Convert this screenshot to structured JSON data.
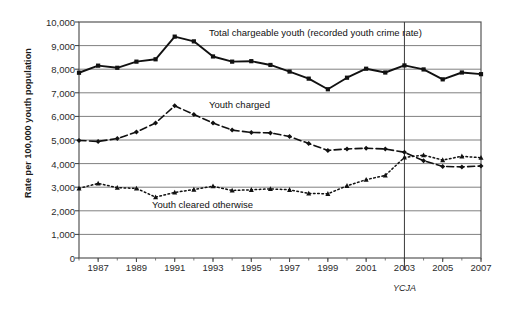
{
  "chart_data": {
    "type": "line",
    "title": "",
    "xlabel": "",
    "ylabel": "Rate per 100,000 youth population",
    "x": [
      1986,
      1987,
      1988,
      1989,
      1990,
      1991,
      1992,
      1993,
      1994,
      1995,
      1996,
      1997,
      1998,
      1999,
      2000,
      2001,
      2002,
      2003,
      2004,
      2005,
      2006,
      2007
    ],
    "xlim": [
      1986,
      2007
    ],
    "ylim": [
      0,
      10000
    ],
    "ytick_labels": [
      "10,000",
      "9,000",
      "8,000",
      "7,000",
      "6,000",
      "5,000",
      "4,000",
      "3,000",
      "2,000",
      "1,000",
      "0"
    ],
    "ytick_values": [
      10000,
      9000,
      8000,
      7000,
      6000,
      5000,
      4000,
      3000,
      2000,
      1000,
      0
    ],
    "xtick_labels": [
      "1987",
      "1989",
      "1991",
      "1993",
      "1995",
      "1997",
      "1999",
      "2001",
      "2003",
      "2005",
      "2007"
    ],
    "xtick_values": [
      1987,
      1989,
      1991,
      1993,
      1995,
      1997,
      1999,
      2001,
      2003,
      2005,
      2007
    ],
    "grid": true,
    "legend_position": "inline-annotations",
    "annotations": [
      {
        "text": "YCJA",
        "x": 2003,
        "type": "vertical-line-label"
      }
    ],
    "series": [
      {
        "name": "Total chargeable youth (recorded youth crime rate)",
        "style": "solid",
        "marker": "square",
        "values": [
          7850,
          8150,
          8060,
          8320,
          8420,
          9380,
          9180,
          8540,
          8320,
          8340,
          8180,
          7900,
          7600,
          7150,
          7640,
          8020,
          7860,
          8160,
          7990,
          7570,
          7860,
          7790
        ]
      },
      {
        "name": "Youth charged",
        "style": "dashed",
        "marker": "diamond",
        "values": [
          4980,
          4940,
          5060,
          5340,
          5720,
          6450,
          6080,
          5720,
          5420,
          5320,
          5300,
          5150,
          4850,
          4560,
          4620,
          4650,
          4620,
          4480,
          4120,
          3880,
          3860,
          3900
        ]
      },
      {
        "name": "Youth cleared otherwise",
        "style": "dotted",
        "marker": "triangle",
        "values": [
          2950,
          3160,
          2980,
          2950,
          2580,
          2780,
          2900,
          3040,
          2860,
          2890,
          2930,
          2890,
          2740,
          2720,
          3060,
          3320,
          3500,
          4260,
          4360,
          4150,
          4310,
          4250
        ]
      }
    ]
  },
  "labels": {
    "series_total": "Total chargeable youth (recorded youth crime rate)",
    "series_charged": "Youth charged",
    "series_cleared": "Youth cleared otherwise",
    "ycja": "YCJA",
    "y_axis_title": "Rate per 100,000 youth population"
  },
  "colors": {
    "line": "#111111",
    "grid": "#808080",
    "frame": "#555555",
    "text": "#1f1f1f",
    "background": "#ffffff"
  },
  "background_artifacts": {
    "top_line": "the figure is a scan of a printed page",
    "bottom_line": "faint bleed-through text from reverse side"
  }
}
